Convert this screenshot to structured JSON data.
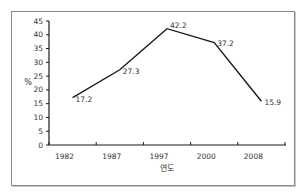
{
  "chart_data": {
    "type": "line",
    "title": "",
    "xlabel": "연도",
    "ylabel": "%",
    "categories": [
      "1982",
      "1987",
      "1997",
      "2000",
      "2008"
    ],
    "values": [
      17.2,
      27.3,
      42.2,
      37.2,
      15.9
    ],
    "data_labels": [
      "17.2",
      "27.3",
      "42.2",
      "37.2",
      "15.9"
    ],
    "ylim": [
      0,
      45
    ],
    "yticks": [
      "0",
      "5",
      "10",
      "15",
      "20",
      "25",
      "30",
      "35",
      "40",
      "45"
    ],
    "grid": false,
    "legend": "none",
    "line_color": "#1a1a1a"
  }
}
